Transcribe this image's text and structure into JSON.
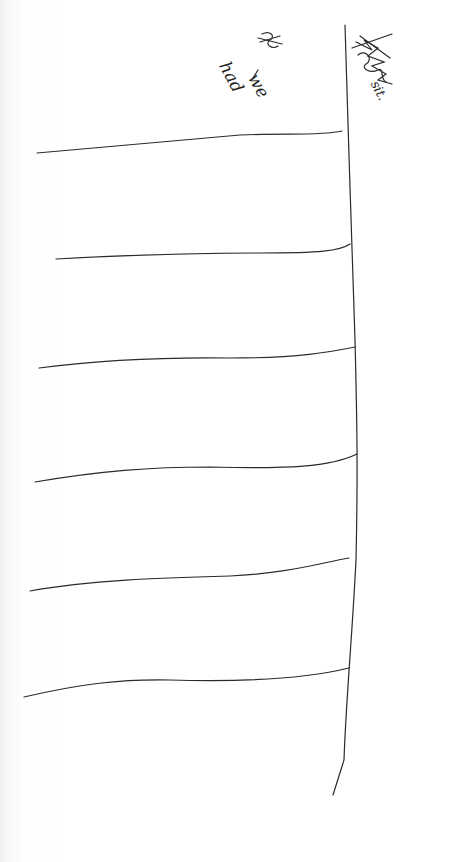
{
  "page": {
    "type": "handwritten-scan",
    "ink_color": "#2a2a2a",
    "paper_color": "#ffffff"
  },
  "annotations": {
    "left_note": {
      "crossed_out_prefix": "$",
      "words": [
        "we",
        "had"
      ]
    },
    "right_note": {
      "scribbled_word": "(illegible, scribbled out)",
      "word": "sit."
    }
  },
  "table": {
    "vertical_divider": {
      "x_top": 345,
      "y_top": 25,
      "x_bottom": 333,
      "y_bottom": 795
    },
    "rows": [
      {
        "y": 145,
        "label": ""
      },
      {
        "y": 250,
        "label": ""
      },
      {
        "y": 358,
        "label": ""
      },
      {
        "y": 465,
        "label": ""
      },
      {
        "y": 572,
        "label": ""
      },
      {
        "y": 680,
        "label": ""
      }
    ]
  }
}
